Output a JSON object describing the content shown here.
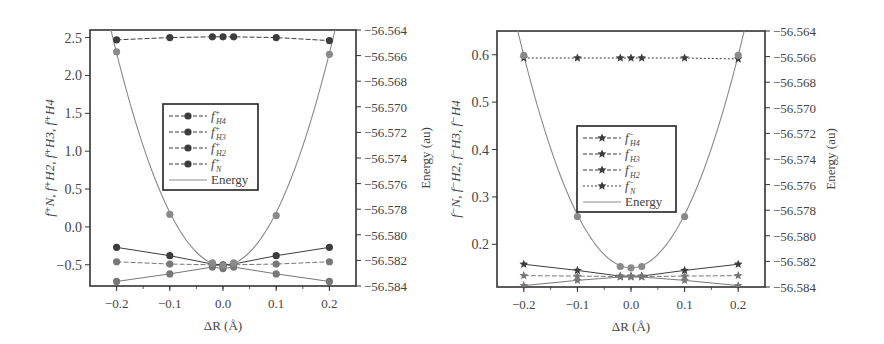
{
  "chart_data": [
    {
      "type": "line",
      "title": "",
      "xlabel": "ΔR (Å)",
      "ylabel": "f⁺N, f⁺H2, f⁺H3, f⁺H4",
      "y2label": "Energy (au)",
      "xlim": [
        -0.25,
        0.25
      ],
      "ylim": [
        -0.78,
        2.6
      ],
      "y2lim": [
        -56.584,
        -56.564
      ],
      "xticks": [
        "-0.2",
        "-0.1",
        "0.0",
        "0.1",
        "0.2"
      ],
      "yticks": [
        "-0.5",
        "0.0",
        "0.5",
        "1.0",
        "1.5",
        "2.0",
        "2.5"
      ],
      "y2ticks": [
        "-56.564",
        "-56.566",
        "-56.568",
        "-56.570",
        "-56.572",
        "-56.574",
        "-56.576",
        "-56.578",
        "-56.580",
        "-56.582",
        "-56.584"
      ],
      "x": [
        -0.2,
        -0.1,
        -0.02,
        0.0,
        0.02,
        0.1,
        0.2
      ],
      "series": [
        {
          "name": "f⁺H4",
          "marker": "circle",
          "values": [
            -0.27,
            -0.38,
            -0.49,
            -0.5,
            -0.49,
            -0.38,
            -0.27
          ]
        },
        {
          "name": "f⁺H3",
          "marker": "circle",
          "values": [
            -0.46,
            -0.49,
            -0.5,
            -0.52,
            -0.5,
            -0.49,
            -0.46
          ]
        },
        {
          "name": "f⁺H2",
          "marker": "circle",
          "values": [
            -0.72,
            -0.62,
            -0.53,
            -0.55,
            -0.53,
            -0.62,
            -0.72
          ]
        },
        {
          "name": "f⁺N",
          "marker": "circle",
          "values": [
            2.47,
            2.5,
            2.51,
            2.51,
            2.51,
            2.5,
            2.46
          ]
        },
        {
          "name": "Energy",
          "axis": "y2",
          "marker": "circle",
          "values": [
            -56.5657,
            -56.5784,
            -56.5822,
            -56.5824,
            -56.5822,
            -56.5785,
            -56.5659
          ]
        }
      ],
      "legend": {
        "position": "center-left",
        "entries": [
          {
            "label": "f",
            "sup": "+",
            "sub": "H4",
            "style": "dash-circle"
          },
          {
            "label": "f",
            "sup": "+",
            "sub": "H3",
            "style": "dash-circle"
          },
          {
            "label": "f",
            "sup": "+",
            "sub": "H2",
            "style": "dash-circle"
          },
          {
            "label": "f",
            "sup": "+",
            "sub": "N",
            "style": "dash-circle"
          },
          {
            "label": "Energy",
            "sup": "",
            "sub": "",
            "style": "solid"
          }
        ]
      },
      "grid": false
    },
    {
      "type": "line",
      "title": "",
      "xlabel": "ΔR (Å)",
      "ylabel": "f⁻N, f⁻H2, f⁻H3, f⁻H4",
      "y2label": "Energy (au)",
      "xlim": [
        -0.25,
        0.25
      ],
      "ylim": [
        0.11,
        0.65
      ],
      "y2lim": [
        -56.584,
        -56.564
      ],
      "xticks": [
        "-0.2",
        "-0.1",
        "0.0",
        "0.1",
        "0.2"
      ],
      "yticks": [
        "0.2",
        "0.3",
        "0.4",
        "0.5",
        "0.6"
      ],
      "y2ticks": [
        "-56.564",
        "-56.566",
        "-56.568",
        "-56.570",
        "-56.572",
        "-56.574",
        "-56.576",
        "-56.578",
        "-56.580",
        "-56.582",
        "-56.584"
      ],
      "x": [
        -0.2,
        -0.1,
        -0.02,
        0.0,
        0.02,
        0.1,
        0.2
      ],
      "series": [
        {
          "name": "f⁻H4",
          "marker": "star",
          "values": [
            0.158,
            0.145,
            0.133,
            0.133,
            0.133,
            0.145,
            0.158
          ]
        },
        {
          "name": "f⁻H3",
          "marker": "star",
          "values": [
            0.134,
            0.133,
            0.132,
            0.132,
            0.132,
            0.133,
            0.134
          ]
        },
        {
          "name": "f⁻H2",
          "marker": "star",
          "values": [
            0.113,
            0.124,
            0.131,
            0.131,
            0.131,
            0.124,
            0.113
          ]
        },
        {
          "name": "f⁻N",
          "marker": "star",
          "values": [
            0.593,
            0.593,
            0.593,
            0.593,
            0.593,
            0.593,
            0.591
          ]
        },
        {
          "name": "Energy",
          "axis": "y2",
          "marker": "circle",
          "values": [
            -56.5659,
            -56.5785,
            -56.5824,
            -56.5825,
            -56.5824,
            -56.5785,
            -56.5659
          ]
        }
      ],
      "legend": {
        "position": "center-left",
        "entries": [
          {
            "label": "f",
            "sup": "−",
            "sub": "H4",
            "style": "dash-star"
          },
          {
            "label": "f",
            "sup": "−",
            "sub": "H3",
            "style": "dash-star"
          },
          {
            "label": "f",
            "sup": "−",
            "sub": "H2",
            "style": "dash-star"
          },
          {
            "label": "f",
            "sup": "−",
            "sub": "N",
            "style": "dot-star"
          },
          {
            "label": "Energy",
            "sup": "",
            "sub": "",
            "style": "solid"
          }
        ]
      },
      "grid": false
    }
  ],
  "colors": {
    "axis": "#333333",
    "series_dark": "#3d3d3d",
    "series_mid": "#777777",
    "energy_curve": "#8a8a8a",
    "text": "#444444"
  }
}
